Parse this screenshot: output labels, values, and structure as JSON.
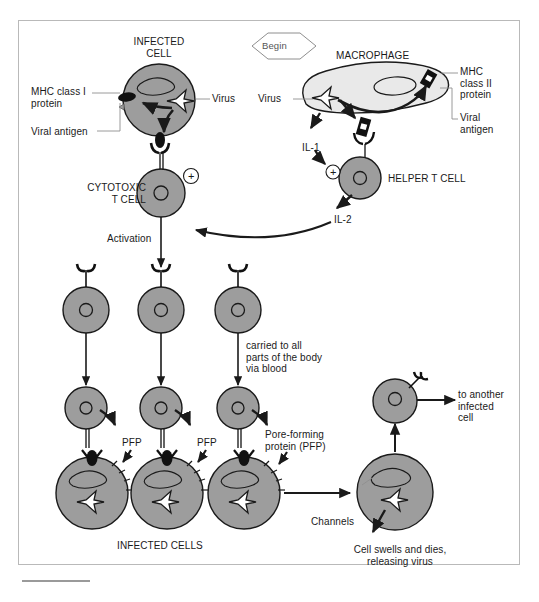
{
  "diagram": {
    "begin_marker": "Begin",
    "colors": {
      "cell_gray": "#9d9d9d",
      "macrophage_gray": "#e9e9e9",
      "outline": "#1a1a1a",
      "frame": "#b9b9b9",
      "text": "#1a1a1a"
    }
  },
  "labels": {
    "infected_cell": "INFECTED\nCELL",
    "mhc_class_i": "MHC class I\nprotein",
    "viral_antigen_left": "Viral antigen",
    "virus_left": "Virus",
    "macrophage": "MACROPHAGE",
    "virus_right": "Virus",
    "mhc_class_ii": "MHC\nclass II\nprotein",
    "viral_antigen_right": "Viral\nantigen",
    "il1": "IL-1",
    "helper_t_cell": "HELPER T CELL",
    "il2": "IL-2",
    "cytotoxic_t_cell": "CYTOTOXIC\nT CELL",
    "activation": "Activation",
    "carried": "carried to all\nparts of the body\nvia blood",
    "pfp_1": "PFP",
    "pfp_2": "PFP",
    "pore_forming_protein": "Pore-forming\nprotein (PFP)",
    "infected_cells": "INFECTED CELLS",
    "channels": "Channels",
    "cell_swells": "Cell swells and dies,\nreleasing virus",
    "to_another": "to another\ninfected\ncell"
  },
  "symbols": {
    "plus_cytotoxic": "+",
    "plus_helper": "+"
  }
}
